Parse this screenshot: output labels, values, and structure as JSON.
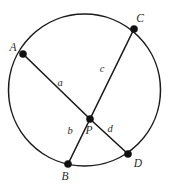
{
  "figure": {
    "background_color": "#ffffff",
    "stroke_color": "#1a1a1a",
    "label_color": "#2b2b2b",
    "width": 172,
    "height": 185
  },
  "circle": {
    "name": "circle-outline",
    "cx": 84.5,
    "cy": 90,
    "r": 76
  },
  "points": [
    {
      "id": "A",
      "label": "A",
      "x": 23,
      "y": 54,
      "label_x": 13,
      "label_y": 51
    },
    {
      "id": "C",
      "label": "C",
      "x": 134,
      "y": 29,
      "label_x": 140,
      "label_y": 22
    },
    {
      "id": "P",
      "label": "P",
      "x": 90,
      "y": 119,
      "label_x": 89,
      "label_y": 134
    },
    {
      "id": "B",
      "label": "B",
      "x": 68,
      "y": 164,
      "label_x": 65,
      "label_y": 180
    },
    {
      "id": "D",
      "label": "D",
      "x": 128,
      "y": 154,
      "label_x": 138,
      "label_y": 167
    }
  ],
  "chords": [
    {
      "id": "AB",
      "from": "A",
      "to": "B",
      "via": "P"
    },
    {
      "id": "CD",
      "from": "C",
      "to": "D",
      "via": "P"
    }
  ],
  "segments": [
    {
      "id": "a",
      "label": "a",
      "from": "A",
      "to": "P",
      "label_x": 60,
      "label_y": 86
    },
    {
      "id": "b",
      "label": "b",
      "from": "P",
      "to": "B",
      "label_x": 70,
      "label_y": 134
    },
    {
      "id": "c",
      "label": "c",
      "from": "C",
      "to": "P",
      "label_x": 102,
      "label_y": 72
    },
    {
      "id": "d",
      "label": "d",
      "from": "P",
      "to": "D",
      "label_x": 110,
      "label_y": 132
    }
  ]
}
